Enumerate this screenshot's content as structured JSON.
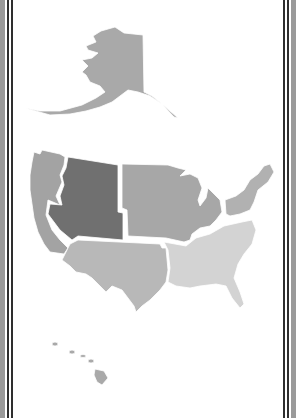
{
  "map": {
    "title": "United States Regions",
    "regions": [
      {
        "id": "alaska",
        "label": "Alaska",
        "color": "#a9a9a9"
      },
      {
        "id": "pacific",
        "label": "Pacific West",
        "color": "#a3a3a3"
      },
      {
        "id": "mountain",
        "label": "Mountain West",
        "color": "#707070"
      },
      {
        "id": "midwest",
        "label": "Midwest",
        "color": "#a7a7a7"
      },
      {
        "id": "northeast",
        "label": "Northeast",
        "color": "#b1b1b1"
      },
      {
        "id": "southwest",
        "label": "Southwest",
        "color": "#b8b8b8"
      },
      {
        "id": "southeast",
        "label": "Southeast",
        "color": "#d3d3d3"
      },
      {
        "id": "hawaii",
        "label": "Hawaii",
        "color": "#a9a9a9"
      }
    ]
  },
  "frame": {
    "band_color": "#9a9a9a",
    "line_color": "#2e2e2e"
  }
}
